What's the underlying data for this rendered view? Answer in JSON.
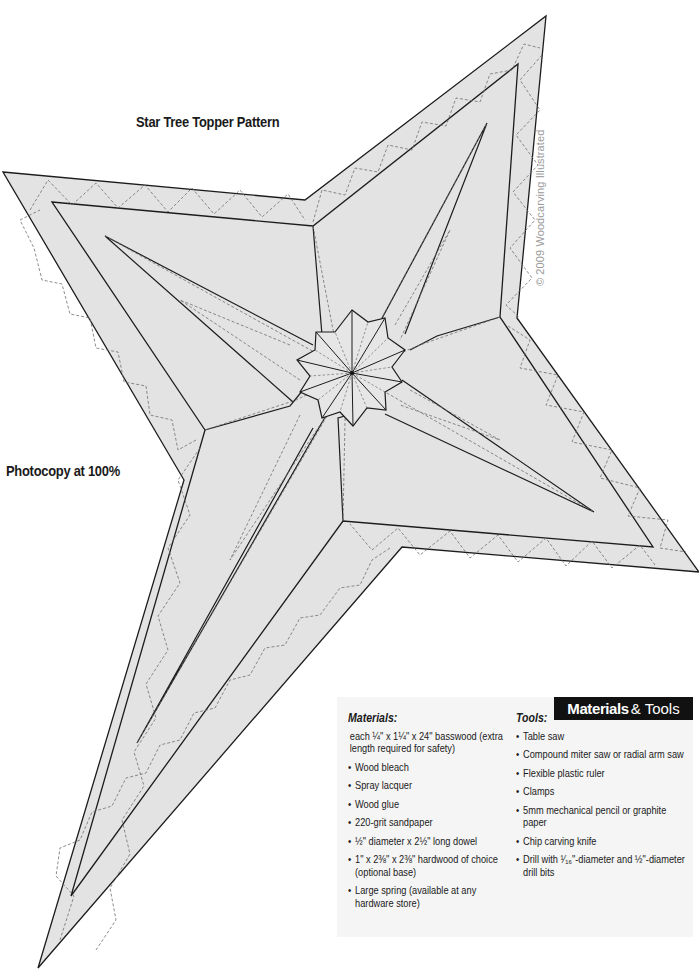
{
  "page": {
    "title": "Star Tree Topper Pattern",
    "instruction": "Photocopy at 100%",
    "copyright": "© 2009 Woodcarving Illustrated"
  },
  "materials_tools": {
    "badge_bold": "Materials",
    "badge_light": "& Tools",
    "materials": {
      "heading": "Materials:",
      "items": [
        {
          "bullet": "",
          "text": "each ¼\" x 1¼\" x 24\" basswood (extra length required for safety)"
        },
        {
          "bullet": "•",
          "text": "Wood bleach"
        },
        {
          "bullet": "•",
          "text": "Spray lacquer"
        },
        {
          "bullet": "•",
          "text": "Wood glue"
        },
        {
          "bullet": "•",
          "text": "220-grit sandpaper"
        },
        {
          "bullet": "•",
          "text": "½\" diameter x 2½\" long dowel"
        },
        {
          "bullet": "•",
          "text": "1\" x 2⅜\" x 2⅜\" hardwood of choice (optional base)"
        },
        {
          "bullet": "•",
          "text": "Large spring (available at any hardware store)"
        }
      ]
    },
    "tools": {
      "heading": "Tools:",
      "items": [
        {
          "bullet": "•",
          "text": "Table saw"
        },
        {
          "bullet": "•",
          "text": "Compound miter saw or radial arm saw"
        },
        {
          "bullet": "•",
          "text": "Flexible plastic ruler"
        },
        {
          "bullet": "•",
          "text": "Clamps"
        },
        {
          "bullet": "•",
          "text": "5mm mechanical pencil or graphite paper"
        },
        {
          "bullet": "•",
          "text": "Chip carving knife"
        },
        {
          "bullet": "•",
          "text": "Drill with ¹⁄₁₆\"-diameter and ½\"-diameter drill bits"
        }
      ]
    }
  },
  "colors": {
    "star_fill": "#e3e3e3",
    "outline": "#1c1c1c",
    "dashed": "#6e6e6e",
    "badge_bg": "#111111",
    "panel_bg": "#f5f5f5",
    "copyright": "#9a9a9a"
  }
}
